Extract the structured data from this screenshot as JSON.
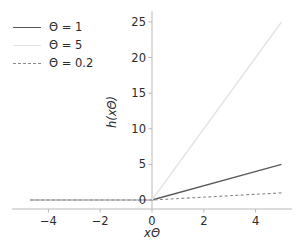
{
  "chart_data": {
    "type": "line",
    "title": "",
    "xlabel": "xΘ",
    "ylabel": "h(xΘ)",
    "xlim": [
      -5.4,
      5.4
    ],
    "ylim": [
      -1.5,
      26.5
    ],
    "xticks": [
      -4,
      -2,
      0,
      2,
      4
    ],
    "xticklabels": [
      "−4",
      "−2",
      "0",
      "2",
      "4"
    ],
    "yticks": [
      0,
      5,
      10,
      15,
      20,
      25
    ],
    "yticklabels": [
      "0",
      "5",
      "10",
      "15",
      "20",
      "25"
    ],
    "grid": false,
    "legend_position": "upper left",
    "x": [
      -5,
      0,
      5
    ],
    "series": [
      {
        "name": "Θ = 1",
        "label": "Θ = 1",
        "slope": 1,
        "values": [
          0,
          0,
          5
        ],
        "linestyle": "solid",
        "color": "#5a5a5a",
        "linewidth": 1.3
      },
      {
        "name": "Θ = 5",
        "label": "Θ = 5",
        "slope": 5,
        "values": [
          0,
          0,
          25
        ],
        "linestyle": "solid",
        "color": "#e3e3e3",
        "linewidth": 1.3
      },
      {
        "name": "Θ = 0.2",
        "label": "Θ = 0.2",
        "slope": 0.2,
        "values": [
          0,
          0,
          1
        ],
        "linestyle": "dashed",
        "color": "#8a8a8a",
        "linewidth": 1.1
      }
    ]
  },
  "axes": {
    "spine_color": "#b9b9b9",
    "tick_color": "#b9b9b9",
    "text_color": "#2b2b2b",
    "background": "#ffffff"
  },
  "legend": {
    "entries": [
      {
        "label": "Θ = 1"
      },
      {
        "label": "Θ = 5"
      },
      {
        "label": "Θ = 0.2"
      }
    ]
  }
}
